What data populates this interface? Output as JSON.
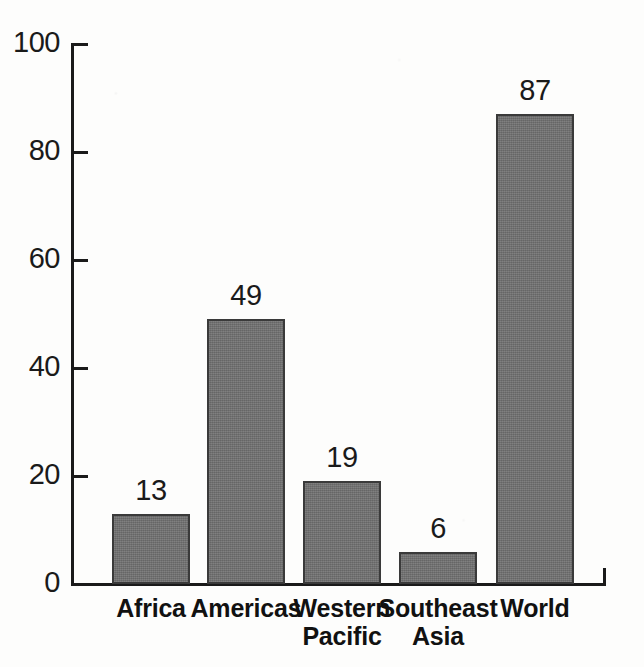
{
  "chart_data": {
    "type": "bar",
    "title": "",
    "subtitle": "",
    "xlabel": "",
    "ylabel": "",
    "categories": [
      "Africa",
      "Americas",
      "Western Pacific",
      "Southeast Asia",
      "World"
    ],
    "values": [
      13,
      49,
      19,
      6,
      87
    ],
    "value_labels": [
      "13",
      "49",
      "19",
      "6",
      "87"
    ],
    "ylim": [
      0,
      100
    ],
    "yticks": [
      0,
      20,
      40,
      60,
      80,
      100
    ],
    "ytick_labels": [
      "0",
      "20",
      "40",
      "60",
      "80",
      "100"
    ],
    "grid": false,
    "legend": false,
    "legend_position": "none",
    "bar_color": "#6f6f6f",
    "bar_border_color": "#3a3a3a",
    "axis_color": "#1a1a1a",
    "background_color": "#fdfdfc",
    "text_color": "#1a1a1a"
  },
  "axis": {
    "y_ticks": [
      {
        "label": "100",
        "value": 100
      },
      {
        "label": "80",
        "value": 80
      },
      {
        "label": "60",
        "value": 60
      },
      {
        "label": "40",
        "value": 40
      },
      {
        "label": "20",
        "value": 20
      },
      {
        "label": "0",
        "value": 0
      }
    ]
  },
  "bars": [
    {
      "category": "Africa",
      "label_line1": "Africa",
      "label_line2": "",
      "value": 13,
      "value_label": "13"
    },
    {
      "category": "Americas",
      "label_line1": "Americas",
      "label_line2": "",
      "value": 49,
      "value_label": "49"
    },
    {
      "category": "Western Pacific",
      "label_line1": "Western",
      "label_line2": "Pacific",
      "value": 19,
      "value_label": "19"
    },
    {
      "category": "Southeast Asia",
      "label_line1": "Southeast",
      "label_line2": "Asia",
      "value": 6,
      "value_label": "6"
    },
    {
      "category": "World",
      "label_line1": "World",
      "label_line2": "",
      "value": 87,
      "value_label": "87"
    }
  ]
}
